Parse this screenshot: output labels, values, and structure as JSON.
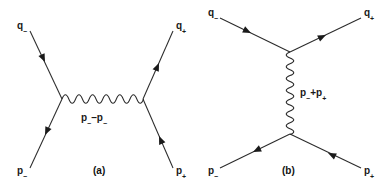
{
  "figure": {
    "background_color": "#ffffff",
    "line_color": "#2b2b2b",
    "text_color": "#1a1a1a",
    "width": 390,
    "height": 189
  },
  "diagrams": [
    {
      "id": "a",
      "caption": "(a)",
      "channel": "t-channel",
      "propagator_label_base": "p",
      "propagator_label": "p−q",
      "propagator_sub_1": "−",
      "propagator_op": "–",
      "propagator_sub_2": "−",
      "propagator_orientation": "horizontal",
      "external_lines": [
        {
          "name": "incoming-electron-top-left",
          "label_base": "q",
          "label_sub": "−",
          "corner": "top-left",
          "arrow_direction": "outward"
        },
        {
          "name": "outgoing-positron-top-right",
          "label_base": "q",
          "label_sub": "+",
          "corner": "top-right",
          "arrow_direction": "inward"
        },
        {
          "name": "incoming-electron-bottom-left",
          "label_base": "p",
          "label_sub": "−",
          "corner": "bottom-left",
          "arrow_direction": "inward"
        },
        {
          "name": "outgoing-positron-bottom-right",
          "label_base": "p",
          "label_sub": "+",
          "corner": "bottom-right",
          "arrow_direction": "outward"
        }
      ],
      "labels": {
        "top_left_base": "q",
        "top_left_sub": "−",
        "top_right_base": "q",
        "top_right_sub": "+",
        "bottom_left_base": "p",
        "bottom_left_sub": "−",
        "bottom_right_base": "p",
        "bottom_right_sub": "+"
      }
    },
    {
      "id": "b",
      "caption": "(b)",
      "channel": "s-channel",
      "propagator_label_base": "p",
      "propagator_label": "p+p",
      "propagator_sub_1": "−",
      "propagator_op": "+",
      "propagator_sub_2": "+",
      "propagator_orientation": "vertical",
      "external_lines": [
        {
          "name": "outgoing-top-left",
          "label_base": "q",
          "label_sub": "−",
          "corner": "top-left",
          "arrow_direction": "outward"
        },
        {
          "name": "incoming-top-right",
          "label_base": "q",
          "label_sub": "+",
          "corner": "top-right",
          "arrow_direction": "inward"
        },
        {
          "name": "incoming-bottom-left",
          "label_base": "p",
          "label_sub": "−",
          "corner": "bottom-left",
          "arrow_direction": "inward"
        },
        {
          "name": "outgoing-bottom-right",
          "label_base": "p",
          "label_sub": "+",
          "corner": "bottom-right",
          "arrow_direction": "outward"
        }
      ],
      "labels": {
        "top_left_base": "q",
        "top_left_sub": "−",
        "top_right_base": "q",
        "top_right_sub": "+",
        "bottom_left_base": "p",
        "bottom_left_sub": "−",
        "bottom_right_base": "p",
        "bottom_right_sub": "+"
      }
    }
  ]
}
